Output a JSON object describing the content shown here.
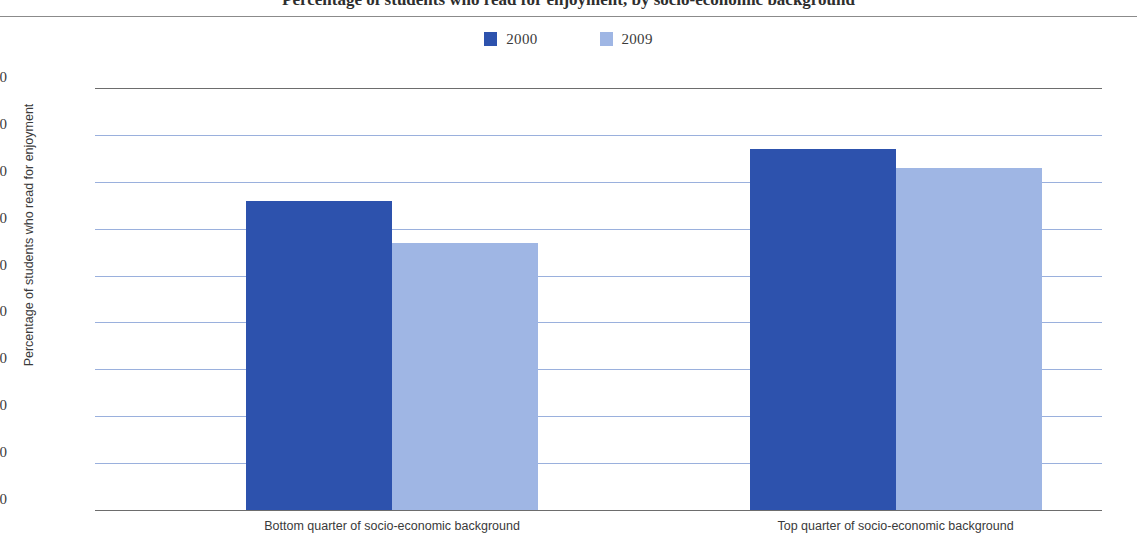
{
  "title": "Percentage of students who read for enjoyment, by socio-economic background",
  "legend": {
    "position": "top-center",
    "items": [
      {
        "label": "2000",
        "color": "#2d52ad"
      },
      {
        "label": "2009",
        "color": "#9fb6e4"
      }
    ]
  },
  "chart_data": {
    "type": "bar",
    "title": "Percentage of students who read for enjoyment, by socio-economic background",
    "xlabel": "",
    "ylabel": "Percentage of students who read for enjoyment",
    "ylim": [
      0,
      90
    ],
    "ytick_labels": [
      "90",
      "80",
      "70",
      "60",
      "50",
      "40",
      "30",
      "20",
      "10",
      "0"
    ],
    "ytick_values": [
      90,
      80,
      70,
      60,
      50,
      40,
      30,
      20,
      10,
      0
    ],
    "ytick_step": 10,
    "grid": true,
    "grid_color": "#9ab0dd",
    "categories": [
      "Bottom quarter of socio-economic background",
      "Top quarter of socio-economic background"
    ],
    "series": [
      {
        "name": "2000",
        "color": "#2d52ad",
        "values": [
          66,
          77
        ]
      },
      {
        "name": "2009",
        "color": "#9fb6e4",
        "values": [
          57,
          73
        ]
      }
    ]
  }
}
